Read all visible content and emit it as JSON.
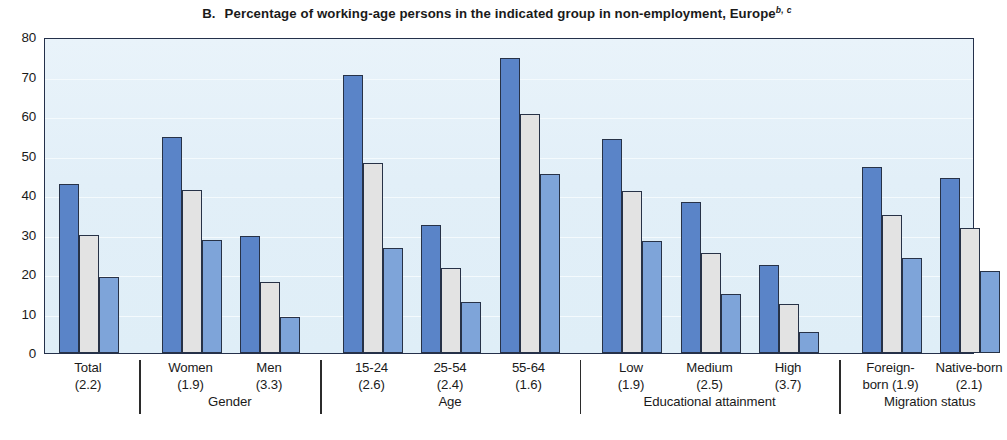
{
  "title": {
    "panel_letter": "B.",
    "text": "Percentage of working-age persons in the indicated group in non-employment, Europe",
    "superscript": "b, c"
  },
  "chart_data": {
    "type": "bar",
    "xlabel": "",
    "ylabel": "",
    "ylim": [
      0,
      80
    ],
    "yticks": [
      0,
      10,
      20,
      30,
      40,
      50,
      60,
      70,
      80
    ],
    "grid": true,
    "legend": "none",
    "colors": {
      "series_1": "#5a84c8",
      "series_2": "#e3e3e3",
      "series_3": "#7ea4d9",
      "plot_background": "#e2eff8",
      "axis": "#24304a"
    },
    "categories": [
      "Total (2.2)",
      "Women (1.9)",
      "Men (3.3)",
      "15-24 (2.6)",
      "25-54 (2.4)",
      "55-64 (1.6)",
      "Low (1.9)",
      "Medium (2.5)",
      "High (3.7)",
      "Foreign-born (1.9)",
      "Native-born (2.1)"
    ],
    "series": [
      {
        "name": "series 1",
        "values": [
          42.7,
          54.6,
          29.7,
          70.5,
          32.4,
          74.6,
          54.2,
          38.2,
          22.4,
          47.1,
          44.2
        ]
      },
      {
        "name": "series 2",
        "values": [
          29.8,
          41.2,
          17.9,
          48.1,
          21.4,
          60.4,
          41.0,
          25.3,
          12.4,
          35.0,
          31.6
        ]
      },
      {
        "name": "series 3",
        "values": [
          19.2,
          28.6,
          9.0,
          26.5,
          13.0,
          45.4,
          28.4,
          14.9,
          5.4,
          24.1,
          20.8
        ]
      }
    ]
  },
  "yaxis": {
    "ticks": [
      "80",
      "70",
      "60",
      "50",
      "40",
      "30",
      "20",
      "10",
      "0"
    ]
  },
  "xaxis": {
    "groups": [
      {
        "group_label": "",
        "categories": [
          {
            "line1": "Total",
            "line2": "(2.2)"
          }
        ]
      },
      {
        "group_label": "Gender",
        "categories": [
          {
            "line1": "Women",
            "line2": "(1.9)"
          },
          {
            "line1": "Men",
            "line2": "(3.3)"
          }
        ]
      },
      {
        "group_label": "Age",
        "categories": [
          {
            "line1": "15-24",
            "line2": "(2.6)"
          },
          {
            "line1": "25-54",
            "line2": "(2.4)"
          },
          {
            "line1": "55-64",
            "line2": "(1.6)"
          }
        ]
      },
      {
        "group_label": "Educational attainment",
        "categories": [
          {
            "line1": "Low",
            "line2": "(1.9)"
          },
          {
            "line1": "Medium",
            "line2": "(2.5)"
          },
          {
            "line1": "High",
            "line2": "(3.7)"
          }
        ]
      },
      {
        "group_label": "Migration status",
        "categories": [
          {
            "line1": "Foreign-",
            "line2": "born (1.9)"
          },
          {
            "line1": "Native-born",
            "line2": "(2.1)"
          }
        ]
      }
    ]
  }
}
